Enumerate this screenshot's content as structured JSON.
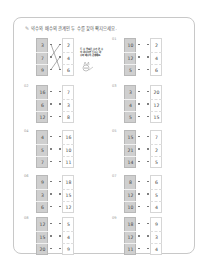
{
  "worksheet": {
    "instruction": "약수와 배수의 관계인 두 수를 찾아 짝지으세요.",
    "pencil_icon": "pencil-icon",
    "example_bubble": "두 수 중 작은 수가 큰 수의 약수이면 두 수는 약수와 배수의 관계예요.",
    "problems": [
      {
        "label": "",
        "is_example": true,
        "left": [
          "3",
          "7",
          "9"
        ],
        "right": [
          "2",
          "4",
          "6"
        ]
      },
      {
        "label": "01",
        "left": [
          "10",
          "12",
          "5"
        ],
        "right": [
          "2",
          "4",
          "6"
        ]
      },
      {
        "label": "02",
        "left": [
          "16",
          "6",
          "12"
        ],
        "right": [
          "7",
          "3",
          "8"
        ]
      },
      {
        "label": "03",
        "left": [
          "3",
          "4",
          "5"
        ],
        "right": [
          "20",
          "12",
          "15"
        ]
      },
      {
        "label": "04",
        "left": [
          "4",
          "5",
          "7"
        ],
        "right": [
          "16",
          "10",
          "11"
        ]
      },
      {
        "label": "05",
        "left": [
          "15",
          "21",
          "14"
        ],
        "right": [
          "7",
          "2",
          "5"
        ]
      },
      {
        "label": "06",
        "left": [
          "9",
          "3",
          "6"
        ],
        "right": [
          "18",
          "15",
          "12"
        ]
      },
      {
        "label": "07",
        "left": [
          "8",
          "12",
          "10"
        ],
        "right": [
          "6",
          "5",
          "4"
        ]
      },
      {
        "label": "08",
        "left": [
          "12",
          "15",
          "20"
        ],
        "right": [
          "5",
          "4",
          "9"
        ]
      },
      {
        "label": "09",
        "left": [
          "18",
          "12",
          "11"
        ],
        "right": [
          "9",
          "3",
          "4"
        ]
      }
    ]
  }
}
